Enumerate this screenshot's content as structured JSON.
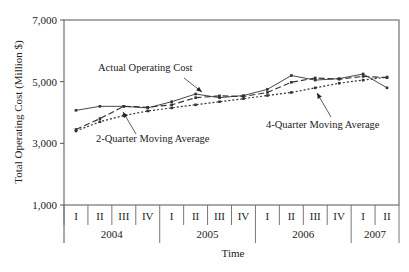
{
  "chart_data": {
    "type": "line",
    "title": "",
    "xlabel": "Time",
    "ylabel": "Total Operating Cost (Million $)",
    "ylim": [
      1000,
      7000
    ],
    "yticks": [
      1000,
      3000,
      5000,
      7000
    ],
    "ytick_labels": [
      "1,000",
      "3,000",
      "5,000",
      "7,000"
    ],
    "grid": false,
    "categories": [
      "I",
      "II",
      "III",
      "IV",
      "I",
      "II",
      "III",
      "IV",
      "I",
      "II",
      "III",
      "IV",
      "I",
      "II"
    ],
    "year_groups": [
      {
        "label": "2004",
        "quarters": 4
      },
      {
        "label": "2005",
        "quarters": 4
      },
      {
        "label": "2006",
        "quarters": 4
      },
      {
        "label": "2007",
        "quarters": 2
      }
    ],
    "series": [
      {
        "name": "Actual Operating Cost",
        "style": "solid",
        "values": [
          4070,
          4200,
          4200,
          4150,
          4350,
          4600,
          4480,
          4550,
          4750,
          5200,
          5050,
          5100,
          5250,
          4800
        ]
      },
      {
        "name": "2-Quarter Moving Average",
        "style": "dashed",
        "values": [
          3450,
          3800,
          4200,
          4170,
          4250,
          4480,
          4540,
          4520,
          4650,
          4980,
          5120,
          5080,
          5170,
          5130
        ]
      },
      {
        "name": "4-Quarter Moving Average",
        "style": "dotted",
        "values": [
          3400,
          3700,
          3900,
          4050,
          4150,
          4250,
          4350,
          4450,
          4550,
          4650,
          4800,
          4950,
          5050,
          5150
        ]
      }
    ],
    "annotations": [
      {
        "text": "Actual Operating Cost"
      },
      {
        "text": "2-Quarter Moving Average"
      },
      {
        "text": "4-Quarter Moving Average"
      }
    ]
  }
}
